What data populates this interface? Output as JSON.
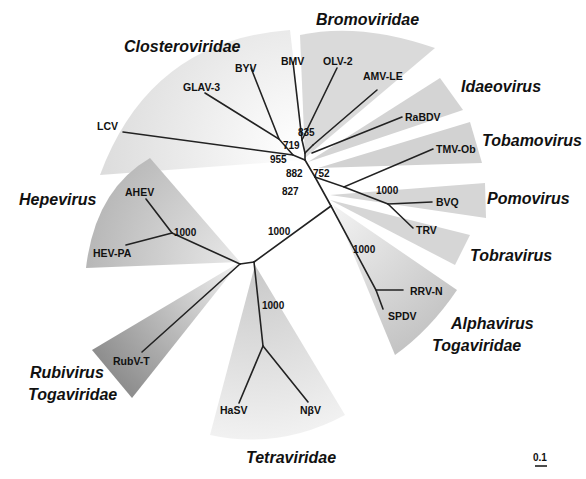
{
  "figure": {
    "type": "unrooted phylogenetic tree",
    "scale_bar": "0.1"
  },
  "groups": [
    {
      "name": "Closteroviridae",
      "taxa": [
        "LCV",
        "GLAV-3",
        "BYV"
      ]
    },
    {
      "name": "Bromoviridae",
      "taxa": [
        "BMV",
        "OLV-2",
        "AMV-LE"
      ]
    },
    {
      "name": "Idaeovirus",
      "taxa": [
        "RaBDV"
      ]
    },
    {
      "name": "Tobamovirus",
      "taxa": [
        "TMV-Ob"
      ]
    },
    {
      "name": "Pomovirus",
      "taxa": [
        "BVQ"
      ]
    },
    {
      "name": "Tobravirus",
      "taxa": [
        "TRV"
      ]
    },
    {
      "name": "Alphavirus",
      "subname": "Togaviridae",
      "taxa": [
        "RRV-N",
        "SPDV"
      ]
    },
    {
      "name": "Tetraviridae",
      "taxa": [
        "HaSV",
        "NβV"
      ]
    },
    {
      "name": "Rubivirus",
      "subname": "Togaviridae",
      "taxa": [
        "RubV-T"
      ]
    },
    {
      "name": "Hepevirus",
      "taxa": [
        "AHEV",
        "HEV-PA"
      ]
    }
  ],
  "taxa": {
    "LCV": "LCV",
    "GLAV3": "GLAV-3",
    "BYV": "BYV",
    "BMV": "BMV",
    "OLV2": "OLV-2",
    "AMVLE": "AMV-LE",
    "RaBDV": "RaBDV",
    "TMVOb": "TMV-Ob",
    "BVQ": "BVQ",
    "TRV": "TRV",
    "RRVN": "RRV-N",
    "SPDV": "SPDV",
    "HaSV": "HaSV",
    "NbV": "NβV",
    "RubVT": "RubV-T",
    "AHEV": "AHEV",
    "HEVPA": "HEV-PA"
  },
  "group_labels": {
    "closteroviridae": "Closteroviridae",
    "bromoviridae": "Bromoviridae",
    "idaeovirus": "Idaeovirus",
    "tobamovirus": "Tobamovirus",
    "pomovirus": "Pomovirus",
    "tobravirus": "Tobravirus",
    "alphavirus": "Alphavirus",
    "alphavirus_family": "Togaviridae",
    "tetraviridae": "Tetraviridae",
    "rubivirus": "Rubivirus",
    "rubivirus_family": "Togaviridae",
    "hepevirus": "Hepevirus"
  },
  "bootstrap": {
    "b835": "835",
    "b719": "719",
    "b955": "955",
    "b882": "882",
    "b752": "752",
    "b1000_pomo_tobra": "1000",
    "b827": "827",
    "b1000_central": "1000",
    "b1000_alpha": "1000",
    "b1000_hepe": "1000",
    "b1000_tetra": "1000"
  },
  "colors": {
    "sector_light": "#e4e4e4",
    "sector_mid": "#cfcfcf",
    "sector_dark": "#b4b4b4",
    "branch": "#222222"
  }
}
